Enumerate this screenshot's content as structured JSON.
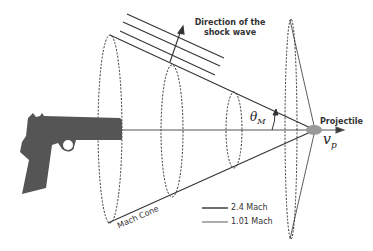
{
  "labels": {
    "shock_direction_line1": "Direction of the",
    "shock_direction_line2": "shock wave",
    "theta": "θ",
    "theta_sub": "M",
    "projectile": "Projectile",
    "velocity": "v",
    "velocity_sub": "p",
    "mach_cone": "Mach Cone"
  },
  "legend": {
    "items": [
      {
        "label": "2.4 Mach"
      },
      {
        "label": "1.01 Mach"
      }
    ]
  },
  "colors": {
    "line": "#333333",
    "gun": "#555555",
    "projectile": "#888888"
  }
}
